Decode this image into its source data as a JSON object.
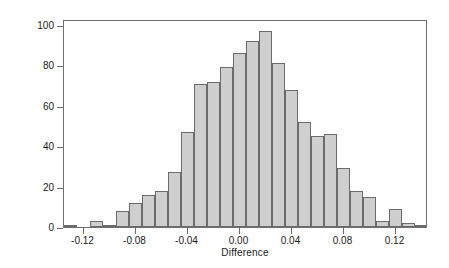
{
  "chart_data": {
    "type": "bar",
    "subtype": "histogram",
    "title": "",
    "xlabel": "Difference",
    "ylabel": "Frequency",
    "xlim": [
      -0.135,
      0.145
    ],
    "ylim": [
      0,
      103
    ],
    "grid": false,
    "legend": null,
    "bin_width": 0.01,
    "bar_fill_color": "#cfcfcf",
    "bar_edge_color": "#6b6b6b",
    "axis_color": "#6e6e6e",
    "yticks": [
      0,
      20,
      40,
      60,
      80,
      100
    ],
    "ytick_labels": [
      "0",
      "20",
      "40",
      "60",
      "80",
      "100"
    ],
    "xticks": [
      -0.12,
      -0.08,
      -0.04,
      0.0,
      0.04,
      0.08,
      0.12
    ],
    "xtick_labels": [
      "-0.12",
      "-0.08",
      "-0.04",
      "0.00",
      "0.04",
      "0.08",
      "0.12"
    ],
    "bin_centers": [
      -0.13,
      -0.12,
      -0.11,
      -0.1,
      -0.09,
      -0.08,
      -0.07,
      -0.06,
      -0.05,
      -0.04,
      -0.03,
      -0.02,
      -0.01,
      0.0,
      0.01,
      0.02,
      0.03,
      0.04,
      0.05,
      0.06,
      0.07,
      0.08,
      0.09,
      0.1,
      0.11,
      0.12,
      0.13,
      0.14
    ],
    "values": [
      1,
      0,
      3,
      1,
      8,
      12,
      16,
      18,
      27,
      47,
      71,
      72,
      79,
      86,
      92,
      97,
      81,
      68,
      52,
      45,
      46,
      29,
      18,
      15,
      3,
      9,
      2,
      1
    ],
    "bars": [
      {
        "center": -0.13,
        "value": 1
      },
      {
        "center": -0.12,
        "value": 0
      },
      {
        "center": -0.11,
        "value": 3
      },
      {
        "center": -0.1,
        "value": 1
      },
      {
        "center": -0.09,
        "value": 8
      },
      {
        "center": -0.08,
        "value": 12
      },
      {
        "center": -0.07,
        "value": 16
      },
      {
        "center": -0.06,
        "value": 18
      },
      {
        "center": -0.05,
        "value": 27
      },
      {
        "center": -0.04,
        "value": 47
      },
      {
        "center": -0.03,
        "value": 71
      },
      {
        "center": -0.02,
        "value": 72
      },
      {
        "center": -0.01,
        "value": 79
      },
      {
        "center": 0.0,
        "value": 86
      },
      {
        "center": 0.01,
        "value": 92
      },
      {
        "center": 0.02,
        "value": 97
      },
      {
        "center": 0.03,
        "value": 81
      },
      {
        "center": 0.04,
        "value": 68
      },
      {
        "center": 0.05,
        "value": 52
      },
      {
        "center": 0.06,
        "value": 45
      },
      {
        "center": 0.07,
        "value": 46
      },
      {
        "center": 0.08,
        "value": 29
      },
      {
        "center": 0.09,
        "value": 18
      },
      {
        "center": 0.1,
        "value": 15
      },
      {
        "center": 0.11,
        "value": 3
      },
      {
        "center": 0.12,
        "value": 9
      },
      {
        "center": 0.13,
        "value": 2
      },
      {
        "center": 0.14,
        "value": 1
      }
    ]
  }
}
